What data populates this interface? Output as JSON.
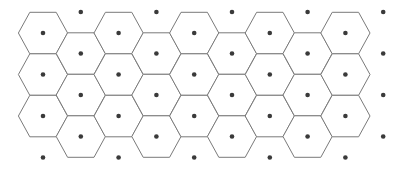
{
  "diagram": {
    "type": "voronoi-hexagonal-lattice",
    "colors": {
      "background": "#ffffff",
      "cell_stroke": "#7a7a7a",
      "site_fill": "#3a3a3a"
    },
    "lattice": {
      "origin_x": 43,
      "column_pitch": 37.8,
      "even_column_first_y": 33,
      "odd_column_first_y": 12,
      "row_pitch": 41.5,
      "site_radius": 2.3,
      "cell_vertex_half_top": 13.2,
      "cell_vertex_half_width": 24.6,
      "cell_half_height": 20.75
    },
    "columns": [
      {
        "index": 0,
        "sites": 4,
        "cells_rows": [
          0,
          1,
          2
        ]
      },
      {
        "index": 1,
        "sites": 4,
        "cells_rows": [
          1,
          2,
          3
        ]
      },
      {
        "index": 2,
        "sites": 4,
        "cells_rows": [
          0,
          1,
          2
        ]
      },
      {
        "index": 3,
        "sites": 4,
        "cells_rows": [
          1,
          2,
          3
        ]
      },
      {
        "index": 4,
        "sites": 4,
        "cells_rows": [
          0,
          1,
          2
        ]
      },
      {
        "index": 5,
        "sites": 4,
        "cells_rows": [
          1,
          2,
          3
        ]
      },
      {
        "index": 6,
        "sites": 4,
        "cells_rows": [
          0,
          1,
          2
        ]
      },
      {
        "index": 7,
        "sites": 4,
        "cells_rows": [
          1,
          2,
          3
        ]
      },
      {
        "index": 8,
        "sites": 4,
        "cells_rows": [
          0,
          1,
          2
        ]
      },
      {
        "index": 9,
        "sites": 4,
        "cells_rows": []
      }
    ],
    "counts": {
      "sites": 40,
      "cells": 27
    }
  }
}
